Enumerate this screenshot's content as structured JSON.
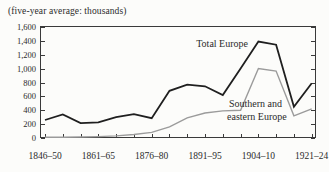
{
  "page": {
    "background": "#fcfcfa",
    "text_color": "#2b2b2b"
  },
  "chart_data": {
    "type": "line",
    "title": "",
    "subtitle": "(five-year average: thousands)",
    "xlabel": "",
    "ylabel": "",
    "n_points": 16,
    "ylim": [
      0,
      1600
    ],
    "grid": false,
    "frame": "box",
    "legend_position": "inline-annotations",
    "y_ticks": [
      0,
      200,
      400,
      600,
      800,
      1000,
      1200,
      1400,
      1600
    ],
    "y_tick_labels": [
      "0",
      "200",
      "400",
      "600",
      "800",
      "1,000",
      "1,200",
      "1,400",
      "1,600"
    ],
    "x_tick_labels": [
      {
        "index": 0,
        "label": "1846–50"
      },
      {
        "index": 3,
        "label": "1861–65"
      },
      {
        "index": 6,
        "label": "1876–80"
      },
      {
        "index": 9,
        "label": "1891–95"
      },
      {
        "index": 12,
        "label": "1904–10"
      },
      {
        "index": 15,
        "label": "1921–24"
      }
    ],
    "series": [
      {
        "name": "Total Europe",
        "color": "#1f1f1f",
        "stroke_width": 1.8,
        "values": [
          260,
          340,
          215,
          225,
          300,
          345,
          285,
          680,
          770,
          745,
          620,
          1000,
          1390,
          1345,
          450,
          790
        ]
      },
      {
        "name": "Southern and eastern Europe",
        "color": "#9b9b9b",
        "stroke_width": 1.4,
        "values": [
          10,
          10,
          15,
          20,
          30,
          50,
          80,
          160,
          290,
          360,
          390,
          400,
          1000,
          965,
          320,
          420
        ]
      }
    ],
    "annotations": [
      {
        "text": "Total Europe",
        "x": 248,
        "y": 47,
        "anchor": "end",
        "series": "Total Europe"
      },
      {
        "text": "Southern and",
        "x": 229,
        "y": 107,
        "anchor": "start",
        "series": "Southern and eastern Europe"
      },
      {
        "text": "eastern Europe",
        "x": 227,
        "y": 120,
        "anchor": "start",
        "series": "Southern and eastern Europe"
      }
    ],
    "axis_color": "#3a3a3a"
  }
}
